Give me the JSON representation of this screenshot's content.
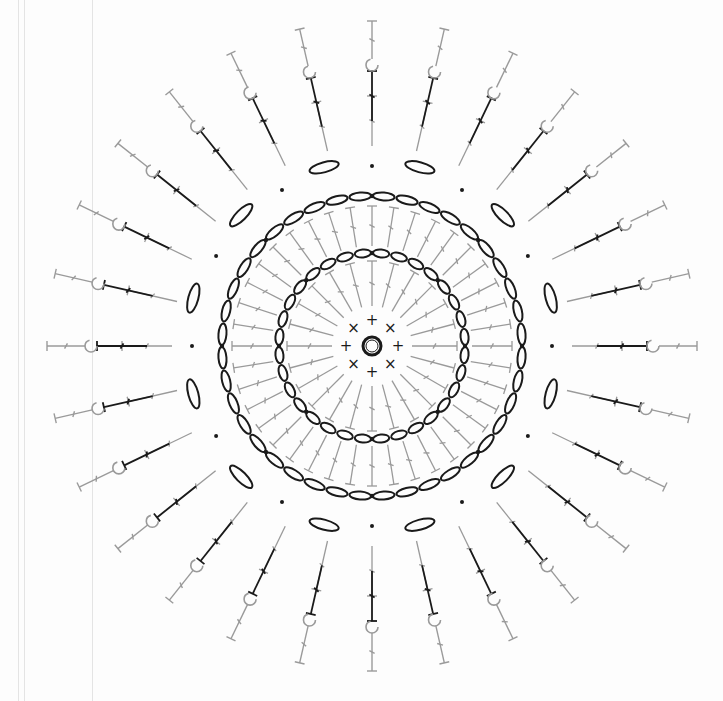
{
  "diagram": {
    "type": "crochet-chart",
    "center": [
      372,
      346
    ],
    "colors": {
      "dark": "#1a1a1a",
      "gray": "#9a9a9a",
      "background": "#fdfdfd"
    },
    "center_ring": {
      "symbol": "magic-ring",
      "radius": 9
    },
    "rounds": [
      {
        "id": 1,
        "symbol": "single-crochet",
        "color": "dark",
        "count": 8,
        "radius": 26,
        "glyphs": [
          "+",
          "×"
        ]
      },
      {
        "id": 2,
        "symbol": "double-crochet-and-chains",
        "color": "gray",
        "count": 24,
        "r_in": 40,
        "r_out": 85
      },
      {
        "id": 3,
        "symbol": "chain-arc",
        "color": "dark",
        "count": 8,
        "radius": 93,
        "chains_per_arc": 4
      },
      {
        "id": 4,
        "symbol": "treble-crochet",
        "color": "gray",
        "count": 40,
        "r_in": 100,
        "r_out": 140
      },
      {
        "id": 5,
        "symbol": "chain-arc",
        "color": "dark",
        "count": 8,
        "radius": 150,
        "chains_per_arc": 5
      },
      {
        "id": 6,
        "symbol": "chain-space-oval",
        "color": "dark",
        "count": 12,
        "radius": 185
      },
      {
        "id": 7,
        "symbol": "extended-stitch-spokes",
        "color": "gray",
        "count": 28,
        "r_in": 200,
        "r_out": 250
      },
      {
        "id": 8,
        "symbol": "post-stitch-spokes",
        "color": "dark",
        "count": 28,
        "r_in": 225,
        "r_out": 275
      },
      {
        "id": 9,
        "symbol": "hook-picot-spokes",
        "color": "gray",
        "count": 28,
        "r_in": 275,
        "r_out": 325
      }
    ],
    "slip_stitch_markers": {
      "symbol": "dot",
      "count": 12
    }
  }
}
